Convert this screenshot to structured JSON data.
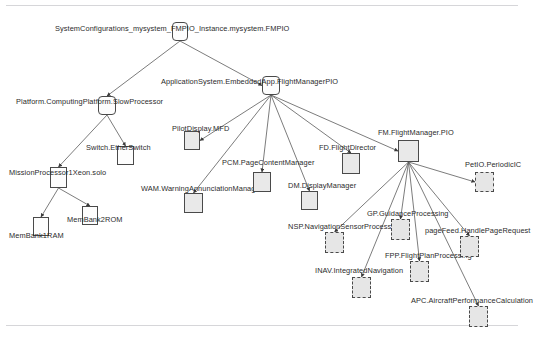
{
  "diagram": {
    "title": "SystemConfigurations_mysystem_FMPIO_Instance.mysystem.FMPIO",
    "type": "hierarchical-tree",
    "rules": {
      "top": "divider-top",
      "bottom": "divider-bottom"
    },
    "nodes": [
      {
        "id": "root",
        "label": "SystemConfigurations_mysystem_FMPIO_Instance.mysystem.FMPIO",
        "x": 172,
        "y": 22,
        "w": 16,
        "h": 19,
        "style": "rounded",
        "label_x": 55,
        "label_y": 24,
        "label_align": "left"
      },
      {
        "id": "appsys",
        "label": "ApplicationSystem.EmbeddedApp.FlightManagerPIO",
        "x": 262,
        "y": 76,
        "w": 18,
        "h": 19,
        "style": "rounded",
        "label_x": 161,
        "label_y": 77,
        "label_align": "left"
      },
      {
        "id": "platform",
        "label": "Platform.ComputingPlatform.SlowProcessor",
        "x": 98,
        "y": 96,
        "w": 18,
        "h": 19,
        "style": "rounded",
        "label_x": 16,
        "label_y": 97,
        "label_align": "left"
      },
      {
        "id": "switch",
        "label": "Switch.EtherSwitch",
        "x": 117,
        "y": 146,
        "w": 17,
        "h": 19,
        "style": "plain",
        "label_x": 86,
        "label_y": 143,
        "label_align": "left"
      },
      {
        "id": "mproc",
        "label": "MissionProcessor1Xeon.solo",
        "x": 50,
        "y": 167,
        "w": 17,
        "h": 21,
        "style": "plain",
        "label_x": 9,
        "label_y": 168,
        "label_align": "left"
      },
      {
        "id": "membank1",
        "label": "MemBank1RAM",
        "x": 33,
        "y": 217,
        "w": 16,
        "h": 19,
        "style": "plain",
        "label_x": 9,
        "label_y": 231,
        "label_align": "left"
      },
      {
        "id": "membank2",
        "label": "MemBank2ROM",
        "x": 82,
        "y": 206,
        "w": 16,
        "h": 19,
        "style": "plain",
        "label_x": 67,
        "label_y": 215,
        "label_align": "left"
      },
      {
        "id": "pilotdisp",
        "label": "PilotDisplay.MFD",
        "x": 184,
        "y": 131,
        "w": 16,
        "h": 19,
        "style": "node",
        "label_x": 172,
        "label_y": 124,
        "label_align": "left"
      },
      {
        "id": "wam",
        "label": "WAM.WarningAnnunciationManager",
        "x": 184,
        "y": 193,
        "w": 19,
        "h": 20,
        "style": "node",
        "label_x": 141,
        "label_y": 184,
        "label_align": "left"
      },
      {
        "id": "pcm",
        "label": "PCM.PageContentManager",
        "x": 253,
        "y": 172,
        "w": 18,
        "h": 20,
        "style": "node",
        "label_x": 222,
        "label_y": 158,
        "label_align": "left"
      },
      {
        "id": "dm",
        "label": "DM.DisplayManager",
        "x": 301,
        "y": 191,
        "w": 17,
        "h": 19,
        "style": "node",
        "label_x": 288,
        "label_y": 181,
        "label_align": "left"
      },
      {
        "id": "fd",
        "label": "FD.FlightDirector",
        "x": 342,
        "y": 153,
        "w": 18,
        "h": 21,
        "style": "node",
        "label_x": 319,
        "label_y": 143,
        "label_align": "left"
      },
      {
        "id": "fm",
        "label": "FM.FlightManager.PIO",
        "x": 398,
        "y": 140,
        "w": 21,
        "h": 22,
        "style": "node",
        "label_x": 378,
        "label_y": 128,
        "label_align": "left"
      },
      {
        "id": "petio",
        "label": "PetIO.PeriodicIC",
        "x": 475,
        "y": 172,
        "w": 19,
        "h": 20,
        "style": "dashed",
        "label_x": 465,
        "label_y": 160,
        "label_align": "left"
      },
      {
        "id": "nsp",
        "label": "NSP.NavigationSensorProcess",
        "x": 325,
        "y": 232,
        "w": 19,
        "h": 21,
        "style": "dashed",
        "label_x": 288,
        "label_y": 222,
        "label_align": "left"
      },
      {
        "id": "inav",
        "label": "INAV.IntegratedNavigation",
        "x": 352,
        "y": 277,
        "w": 19,
        "h": 21,
        "style": "dashed",
        "label_x": 315,
        "label_y": 266,
        "label_align": "left"
      },
      {
        "id": "gp",
        "label": "GP.GuidanceProcessing",
        "x": 391,
        "y": 219,
        "w": 19,
        "h": 21,
        "style": "dashed",
        "label_x": 367,
        "label_y": 209,
        "label_align": "left"
      },
      {
        "id": "fpp",
        "label": "FPP.FlightPlanProcessing",
        "x": 410,
        "y": 261,
        "w": 19,
        "h": 21,
        "style": "dashed",
        "label_x": 385,
        "label_y": 251,
        "label_align": "left"
      },
      {
        "id": "pagefeed",
        "label": "pageFeed.HandlePageRequest",
        "x": 460,
        "y": 236,
        "w": 19,
        "h": 21,
        "style": "dashed",
        "label_x": 425,
        "label_y": 226,
        "label_align": "left"
      },
      {
        "id": "apc",
        "label": "APC.AircraftPerformanceCalculation",
        "x": 469,
        "y": 306,
        "w": 19,
        "h": 21,
        "style": "dashed",
        "label_x": 411,
        "label_y": 296,
        "label_align": "left"
      }
    ],
    "edges": [
      {
        "from": "root",
        "to": "platform"
      },
      {
        "from": "root",
        "to": "appsys"
      },
      {
        "from": "platform",
        "to": "mproc"
      },
      {
        "from": "platform",
        "to": "switch"
      },
      {
        "from": "mproc",
        "to": "membank1"
      },
      {
        "from": "mproc",
        "to": "membank2"
      },
      {
        "from": "appsys",
        "to": "pilotdisp"
      },
      {
        "from": "appsys",
        "to": "wam"
      },
      {
        "from": "appsys",
        "to": "pcm"
      },
      {
        "from": "appsys",
        "to": "dm"
      },
      {
        "from": "appsys",
        "to": "fd"
      },
      {
        "from": "appsys",
        "to": "fm"
      },
      {
        "from": "fm",
        "to": "petio"
      },
      {
        "from": "fm",
        "to": "nsp"
      },
      {
        "from": "fm",
        "to": "inav"
      },
      {
        "from": "fm",
        "to": "gp"
      },
      {
        "from": "fm",
        "to": "fpp"
      },
      {
        "from": "fm",
        "to": "pagefeed"
      },
      {
        "from": "fm",
        "to": "apc"
      }
    ]
  }
}
